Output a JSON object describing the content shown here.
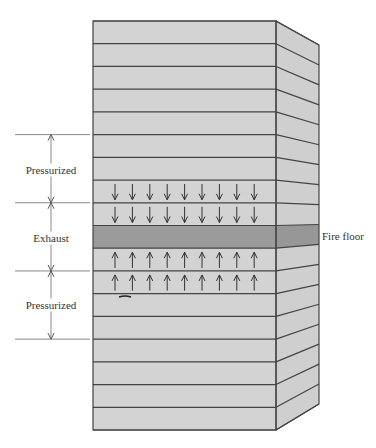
{
  "diagram": {
    "floors_total": 18,
    "fire_floor_index": 9,
    "colors": {
      "floor_fill": "#d3d3d3",
      "side_fill": "#cfcfcf",
      "fire_floor_fill": "#9b9b9b",
      "fire_floor_side_fill": "#979797",
      "line": "#444444",
      "annotation_line": "#888888",
      "arrow": "#333333"
    },
    "zones": [
      {
        "label": "Pressurized",
        "top_floor_line": 5,
        "bottom_floor_line": 8,
        "label_y": 170
      },
      {
        "label": "Exhaust",
        "top_floor_line": 8,
        "bottom_floor_line": 11,
        "label_y": 238
      },
      {
        "label": "Pressurized",
        "top_floor_line": 11,
        "bottom_floor_line": 14,
        "label_y": 305
      }
    ],
    "fire_floor_label": "Fire floor",
    "arrows_per_floor": 9,
    "down_arrow_floors": [
      7,
      8
    ],
    "up_arrow_floors": [
      10,
      11
    ]
  }
}
